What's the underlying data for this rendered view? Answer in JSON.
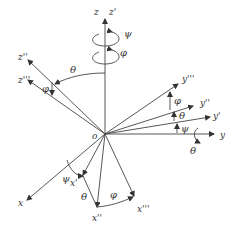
{
  "diagram": {
    "origin_label": "o",
    "axes": {
      "z": "z",
      "z1": "z'",
      "z2": "z''",
      "z3": "z'''",
      "y": "y",
      "y1": "y'",
      "y2": "y''",
      "y3": "y'''",
      "x": "x",
      "x1": "x'",
      "x2": "x''",
      "x3": "x'''"
    },
    "angles": {
      "psi_top": "ψ",
      "phi_top": "φ",
      "theta_top": "θ",
      "phi_z": "φ",
      "phi_y": "φ",
      "theta_y": "θ",
      "psi_y": "ψ",
      "theta_rot_y": "θ",
      "psi_x": "ψ",
      "theta_x": "θ",
      "phi_x": "φ"
    },
    "colors": {
      "line": "#444444",
      "text": "#333333",
      "background": "#ffffff"
    }
  }
}
